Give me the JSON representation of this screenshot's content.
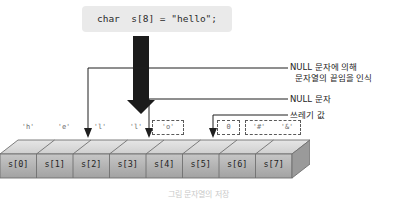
{
  "figure": {
    "code_statement": "char  s[8] = \"hello\";",
    "caption": "그림  문자열의 저장"
  },
  "array": {
    "cells": [
      {
        "index_label": "s[0]",
        "value": "'h'",
        "dashed": false
      },
      {
        "index_label": "s[1]",
        "value": "'e'",
        "dashed": false
      },
      {
        "index_label": "s[2]",
        "value": "'l'",
        "dashed": false
      },
      {
        "index_label": "s[3]",
        "value": "'l'",
        "dashed": false
      },
      {
        "index_label": "s[4]",
        "value": "'o'",
        "dashed": true
      },
      {
        "index_label": "s[5]",
        "value": "0",
        "dashed": true
      },
      {
        "index_label": "s[6]",
        "value": "'#'",
        "dashed": true
      },
      {
        "index_label": "s[7]",
        "value": "'&'",
        "dashed": true
      }
    ]
  },
  "annotations": [
    {
      "line1": "NULL 문자에 의해",
      "line2": "문자열의 끝임을 인식"
    },
    {
      "line1": "NULL 문자",
      "line2": ""
    },
    {
      "line1": "쓰레기 값",
      "line2": ""
    }
  ],
  "colors": {
    "code_box_bg": "#eaeaea",
    "arrow_fill": "#1b1b1b",
    "cell_face": "#b4b4b4",
    "cell_top": "#d8d8d8",
    "cell_side": "#8f8f8f",
    "text": "#262626",
    "dash_stroke": "#5a5a5a"
  }
}
